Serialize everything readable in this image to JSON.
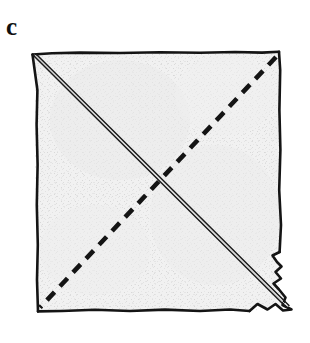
{
  "figure": {
    "panel_label": "c",
    "caption_present": false,
    "background_color": "#ffffff",
    "ink_color": "#141414",
    "paper_fill_color": "#f0f0f0",
    "paper_texture_color": "#d9d9d9",
    "elements": {
      "paper_sheet": {
        "name": "square-paper-sheet",
        "shape": "square",
        "corners": {
          "top_left": [
            32,
            54
          ],
          "top_right": [
            279,
            52
          ],
          "bottom_right": [
            280,
            310
          ],
          "bottom_left": [
            38,
            311
          ]
        },
        "edge_style": "hand-drawn irregular",
        "corner_note": "bottom-right corner is ragged and notched"
      },
      "solid_diagonal": {
        "name": "solid-fold-crease",
        "style": "double-line",
        "from": [
          33,
          56
        ],
        "to": [
          285,
          306
        ],
        "label": "existing fold (valley crease)"
      },
      "dashed_diagonal": {
        "name": "dashed-fold-line",
        "style": "dashed",
        "dash_length": 11,
        "dash_gap": 8,
        "stroke_width": 4.5,
        "from": [
          276,
          57
        ],
        "to": [
          40,
          307
        ],
        "label": "fold line to make next"
      }
    }
  }
}
